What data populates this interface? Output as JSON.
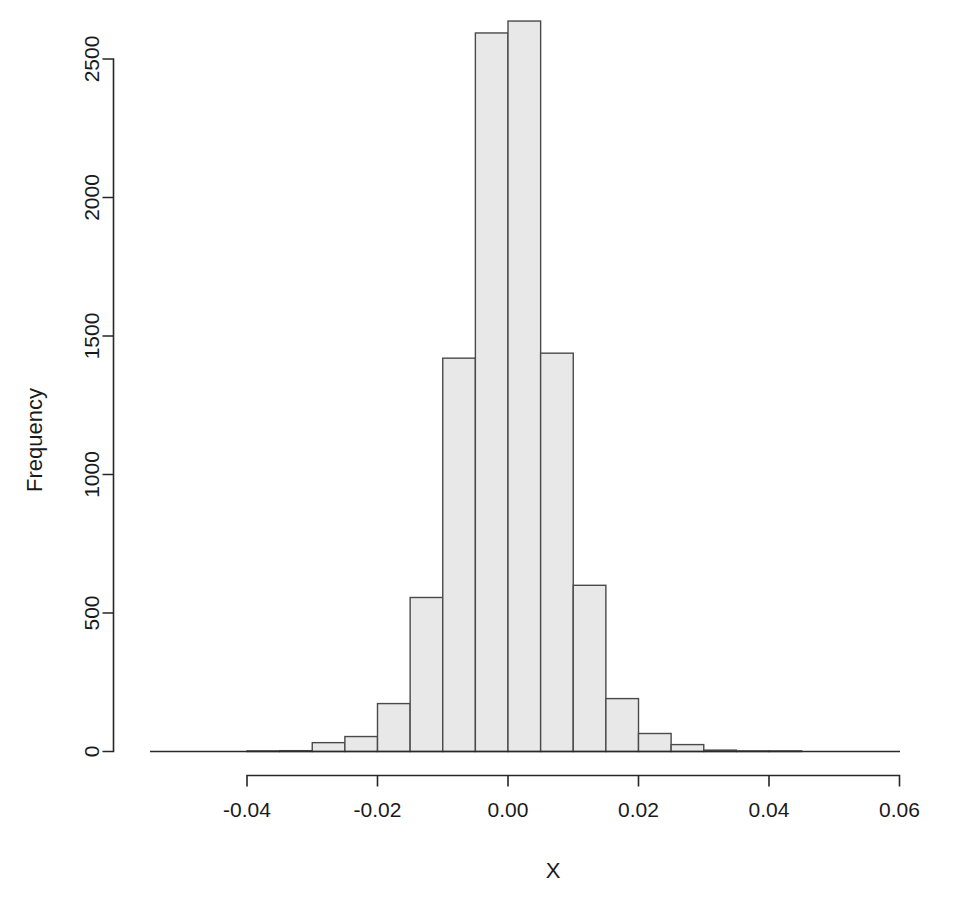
{
  "chart_data": {
    "type": "bar",
    "subtype": "histogram",
    "title": "",
    "xlabel": "X",
    "ylabel": "Frequency",
    "bin_width": 0.005,
    "bin_left_edges": [
      -0.04,
      -0.035,
      -0.03,
      -0.025,
      -0.02,
      -0.015,
      -0.01,
      -0.005,
      0.0,
      0.005,
      0.01,
      0.015,
      0.02,
      0.025,
      0.03,
      0.035,
      0.04
    ],
    "bin_right_edges": [
      -0.035,
      -0.03,
      -0.025,
      -0.02,
      -0.015,
      -0.01,
      -0.005,
      0.0,
      0.005,
      0.01,
      0.015,
      0.02,
      0.025,
      0.03,
      0.035,
      0.04,
      0.045
    ],
    "categories": [
      "-0.040 to -0.035",
      "-0.035 to -0.030",
      "-0.030 to -0.025",
      "-0.025 to -0.020",
      "-0.020 to -0.015",
      "-0.015 to -0.010",
      "-0.010 to -0.005",
      "-0.005 to 0.000",
      "0.000 to 0.005",
      "0.005 to 0.010",
      "0.010 to 0.015",
      "0.015 to 0.020",
      "0.020 to 0.025",
      "0.025 to 0.030",
      "0.030 to 0.035",
      "0.035 to 0.040",
      "0.040 to 0.045"
    ],
    "values": [
      1,
      3,
      32,
      54,
      173,
      556,
      1420,
      2594,
      2637,
      1438,
      600,
      191,
      65,
      25,
      5,
      2,
      1
    ],
    "xlim": [
      -0.046,
      0.064
    ],
    "ylim": [
      0,
      2700
    ],
    "xticks": [
      -0.04,
      -0.02,
      0.0,
      0.02,
      0.04,
      0.06
    ],
    "xtick_labels": [
      "-0.04",
      "-0.02",
      "0.00",
      "0.02",
      "0.04",
      "0.06"
    ],
    "yticks": [
      0,
      500,
      1000,
      1500,
      2000,
      2500
    ],
    "ytick_labels": [
      "0",
      "500",
      "1000",
      "1500",
      "2000",
      "2500"
    ],
    "grid": false,
    "legend": null,
    "bar_fill_color": "#e8e8e8",
    "bar_border_color": "#4a4a4a",
    "axis_color": "#262626",
    "background_color": "#ffffff"
  },
  "axes": {
    "y_title": "Frequency",
    "x_title": "X"
  }
}
